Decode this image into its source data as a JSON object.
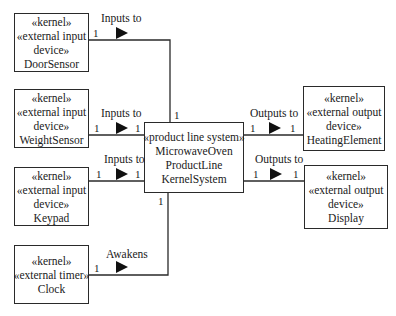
{
  "diagram": {
    "type": "UML context diagram",
    "central": {
      "stereotype": "«product line system»",
      "name_lines": [
        "MicrowaveOven",
        "ProductLine",
        "KernelSystem"
      ]
    },
    "actors": [
      {
        "id": "door",
        "lines": [
          "«kernel»",
          "«external input",
          "device»",
          "DoorSensor"
        ],
        "association": "Inputs to",
        "mult_actor": "1",
        "mult_system": "1"
      },
      {
        "id": "weight",
        "lines": [
          "«kernel»",
          "«external input",
          "device»",
          "WeightSensor"
        ],
        "association": "Inputs to",
        "mult_actor": "1",
        "mult_system": "1"
      },
      {
        "id": "keypad",
        "lines": [
          "«kernel»",
          "«external input",
          "device»",
          "Keypad"
        ],
        "association": "Inputs to",
        "mult_actor": "1",
        "mult_system": "1"
      },
      {
        "id": "clock",
        "lines": [
          "«kernel»",
          "«external timer»",
          "Clock"
        ],
        "association": "Awakens",
        "mult_actor": "1",
        "mult_system": "1"
      },
      {
        "id": "heating",
        "lines": [
          "«kernel»",
          "«external output",
          "device»",
          "HeatingElement"
        ],
        "association": "Outputs to",
        "mult_actor": "1",
        "mult_system": "1"
      },
      {
        "id": "display",
        "lines": [
          "«kernel»",
          "«external output",
          "device»",
          "Display"
        ],
        "association": "Outputs to",
        "mult_actor": "1",
        "mult_system": "1"
      }
    ],
    "colors": {
      "line": "#2a2a2a",
      "text": "#1a1a1a",
      "background": "#ffffff"
    }
  }
}
